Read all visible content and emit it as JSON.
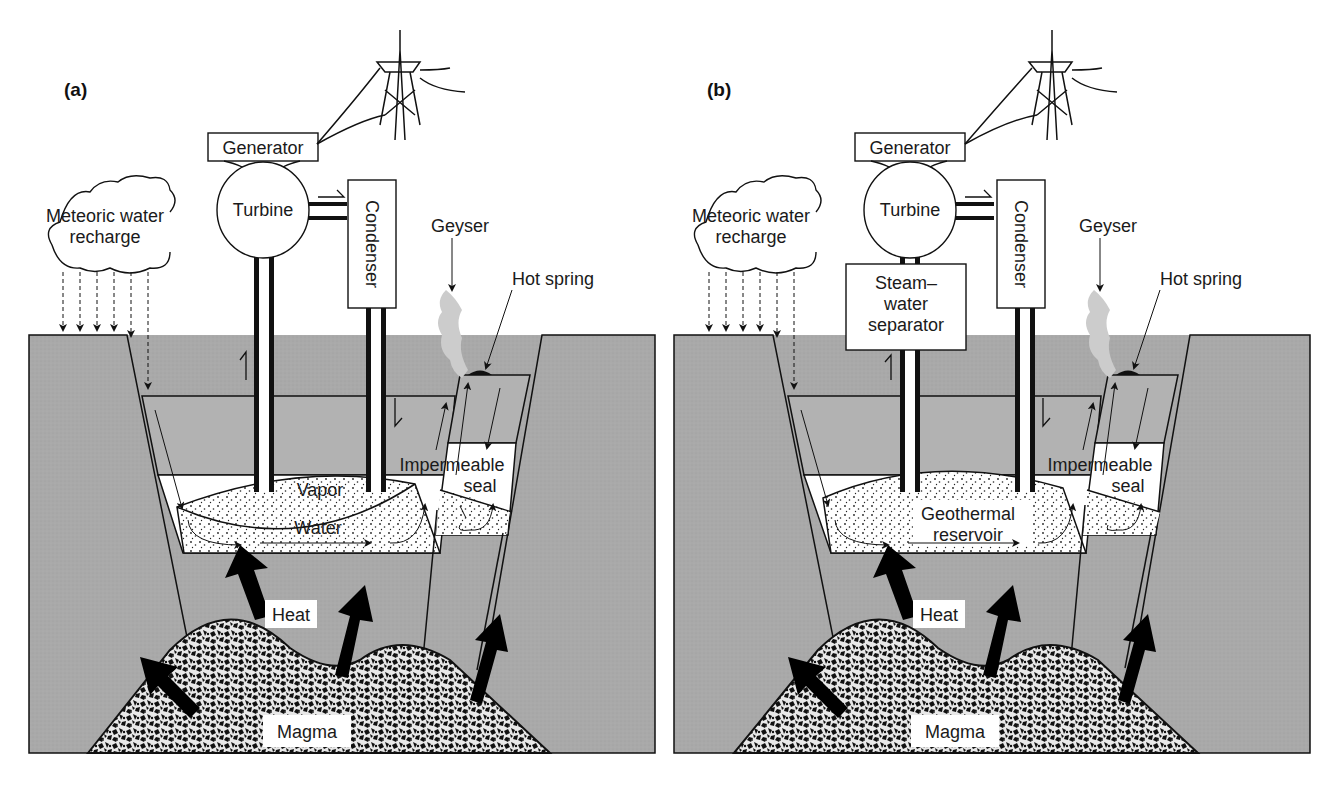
{
  "figure": {
    "panels": [
      {
        "id": "a",
        "letter": "(a)",
        "labels": {
          "generator": "Generator",
          "turbine": "Turbine",
          "condenser": "Condenser",
          "cloud_line1": "Meteoric water",
          "cloud_line2": "recharge",
          "geyser": "Geyser",
          "hot_spring": "Hot spring",
          "seal_line1": "Impermeable",
          "seal_line2": "seal",
          "reservoir_upper": "Vapor",
          "reservoir_lower": "Water",
          "heat": "Heat",
          "magma": "Magma"
        }
      },
      {
        "id": "b",
        "letter": "(b)",
        "labels": {
          "generator": "Generator",
          "turbine": "Turbine",
          "condenser": "Condenser",
          "separator_line1": "Steam–",
          "separator_line2": "water",
          "separator_line3": "separator",
          "cloud_line1": "Meteoric water",
          "cloud_line2": "recharge",
          "geyser": "Geyser",
          "hot_spring": "Hot spring",
          "seal_line1": "Impermeable",
          "seal_line2": "seal",
          "reservoir_upper": "Geothermal",
          "reservoir_lower": "reservoir",
          "heat": "Heat",
          "magma": "Magma"
        }
      }
    ],
    "colors": {
      "rock": "#a8a8a8",
      "layer": "#b4b4b4",
      "white_layer": "#ffffff",
      "steam": "#cfcfcf",
      "line": "#111111",
      "magma_dark": "#1a1a1a"
    }
  }
}
